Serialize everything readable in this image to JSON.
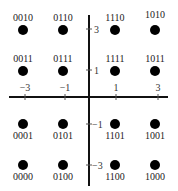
{
  "diagram": {
    "axis_color": "#111111",
    "point_color": "#000000",
    "x_ticks": [
      {
        "label": "−3",
        "value": -3
      },
      {
        "label": "−1",
        "value": -1
      },
      {
        "label": "1",
        "value": 1
      },
      {
        "label": "3",
        "value": 3
      }
    ],
    "y_ticks": [
      {
        "label": "3",
        "value": 3
      },
      {
        "label": "1",
        "value": 1
      },
      {
        "label": "−1",
        "value": -1
      },
      {
        "label": "−3",
        "value": -3
      }
    ],
    "points": [
      {
        "code": "0010",
        "i": -3,
        "q": 3
      },
      {
        "code": "0110",
        "i": -1,
        "q": 3
      },
      {
        "code": "1110",
        "i": 1,
        "q": 3
      },
      {
        "code": "1010",
        "i": 3,
        "q": 3
      },
      {
        "code": "0011",
        "i": -3,
        "q": 1
      },
      {
        "code": "0111",
        "i": -1,
        "q": 1
      },
      {
        "code": "1111",
        "i": 1,
        "q": 1
      },
      {
        "code": "1011",
        "i": 3,
        "q": 1
      },
      {
        "code": "0001",
        "i": -3,
        "q": -1
      },
      {
        "code": "0101",
        "i": -1,
        "q": -1
      },
      {
        "code": "1101",
        "i": 1,
        "q": -1
      },
      {
        "code": "1001",
        "i": 3,
        "q": -1
      },
      {
        "code": "0000",
        "i": -3,
        "q": -3
      },
      {
        "code": "0100",
        "i": -1,
        "q": -3
      },
      {
        "code": "1100",
        "i": 1,
        "q": -3
      },
      {
        "code": "1000",
        "i": 3,
        "q": -3
      }
    ]
  }
}
